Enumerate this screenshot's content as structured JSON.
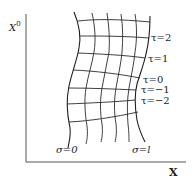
{
  "diagram": {
    "axes": {
      "y_label": "X",
      "y_label_superscript": "0",
      "x_label": "X"
    },
    "worldsheet": {
      "tau_labels": [
        "τ=2",
        "τ=1",
        "τ=0",
        "τ=−1",
        "τ=−2"
      ],
      "sigma_labels": [
        "σ=0",
        "σ=l"
      ]
    },
    "colors": {
      "line": "#2a2a2a",
      "axis": "#555555",
      "background": "#ffffff"
    }
  }
}
